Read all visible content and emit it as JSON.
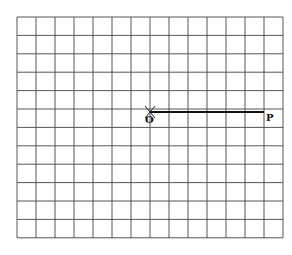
{
  "diagram": {
    "type": "grid-construction",
    "grid": {
      "columns": 14,
      "rows": 12,
      "left": 17,
      "top": 17,
      "cell_width": 19,
      "cell_height": 18.4,
      "line_color": "#555555"
    },
    "points": [
      {
        "label": "O",
        "x": 150,
        "y": 112,
        "marker": "cross"
      },
      {
        "label": "P",
        "x": 264,
        "y": 112,
        "marker": "none"
      }
    ],
    "segments": [
      {
        "from": "O",
        "to": "P",
        "color": "#111111",
        "width": 2
      }
    ]
  }
}
